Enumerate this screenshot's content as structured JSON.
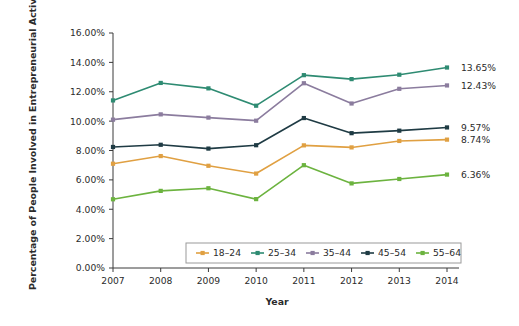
{
  "chart_data": {
    "type": "line",
    "title": "",
    "xlabel": "Year",
    "ylabel": "Percentage of People Involved in Entrepreneurial Activity",
    "categories": [
      "2007",
      "2008",
      "2009",
      "2010",
      "2011",
      "2012",
      "2013",
      "2014"
    ],
    "x": [
      2007,
      2008,
      2009,
      2010,
      2011,
      2012,
      2013,
      2014
    ],
    "xlim": [
      2007,
      2014
    ],
    "ylim": [
      0,
      16
    ],
    "ytick_labels": [
      "0.00%",
      "2.00%",
      "4.00%",
      "6.00%",
      "8.00%",
      "10.00%",
      "12.00%",
      "14.00%",
      "16.00%"
    ],
    "ytick_values": [
      0,
      2,
      4,
      6,
      8,
      10,
      12,
      14,
      16
    ],
    "grid": false,
    "legend_position": "bottom-center",
    "series": [
      {
        "name": "18–24",
        "color": "#E0A042",
        "values": [
          7.1,
          7.62,
          6.96,
          6.43,
          8.35,
          8.21,
          8.65,
          8.74
        ],
        "end_label": "8.74%"
      },
      {
        "name": "25–34",
        "color": "#2E8B72",
        "values": [
          11.41,
          12.6,
          12.23,
          11.05,
          13.13,
          12.86,
          13.16,
          13.65
        ],
        "end_label": "13.65%"
      },
      {
        "name": "35–44",
        "color": "#8B7C9E",
        "values": [
          10.1,
          10.46,
          10.24,
          10.03,
          12.58,
          11.2,
          12.2,
          12.43
        ],
        "end_label": "12.43%"
      },
      {
        "name": "45–54",
        "color": "#1F3B44",
        "values": [
          8.24,
          8.39,
          8.13,
          8.36,
          10.21,
          9.18,
          9.35,
          9.57
        ],
        "end_label": "9.57%"
      },
      {
        "name": "55–64",
        "color": "#6CB33F",
        "values": [
          4.68,
          5.25,
          5.43,
          4.69,
          7.0,
          5.76,
          6.06,
          6.36
        ],
        "end_label": "6.36%"
      }
    ]
  }
}
